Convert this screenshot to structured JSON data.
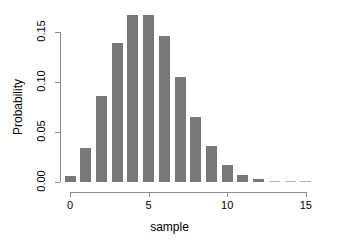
{
  "chart_data": {
    "type": "bar",
    "title": "",
    "subtitle": "",
    "xlabel": "sample",
    "ylabel": "Probability",
    "categories": [
      0,
      1,
      2,
      3,
      4,
      5,
      6,
      7,
      8,
      9,
      10,
      11,
      12,
      13,
      14,
      15
    ],
    "values": [
      0.006,
      0.034,
      0.086,
      0.139,
      0.167,
      0.167,
      0.146,
      0.105,
      0.065,
      0.036,
      0.017,
      0.007,
      0.003,
      0.001,
      0.0004,
      0.0001
    ],
    "x": [
      0,
      1,
      2,
      3,
      4,
      5,
      6,
      7,
      8,
      9,
      10,
      11,
      12,
      13,
      14,
      15
    ],
    "xlim": [
      -0.6,
      15.9
    ],
    "ylim": [
      0.0,
      0.175
    ],
    "xticks": [
      0,
      5,
      10,
      15
    ],
    "xtick_labels": [
      "0",
      "5",
      "10",
      "15"
    ],
    "yticks": [
      0.0,
      0.05,
      0.1,
      0.15
    ],
    "ytick_labels": [
      "0.00",
      "0.05",
      "0.10",
      "0.15"
    ],
    "grid": false,
    "legend": null,
    "legend_position": "none",
    "bar_color": "#787878",
    "axis_color": "#8c8c8c",
    "background_color": "#ffffff",
    "annotations": []
  }
}
